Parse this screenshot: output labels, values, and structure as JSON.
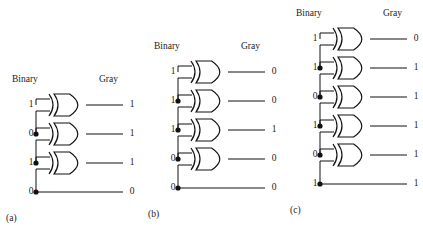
{
  "figure": {
    "background": "#ffffff",
    "line_color": "#111111",
    "text_color": "#1a1a1a"
  },
  "labels": {
    "binary": "Binary",
    "gray": "Gray"
  },
  "panels": [
    {
      "id": "a",
      "caption": "(a)",
      "origin_x": 4,
      "origin_y": 72,
      "header_y": 8,
      "first_row_y": 33,
      "row_step": 29,
      "rows": 4,
      "gates": 3,
      "inputs": [
        "1",
        "0",
        "1",
        "0"
      ],
      "outputs": [
        "1",
        "1",
        "1",
        "0"
      ],
      "binary_label_x": 8,
      "gray_label_x": 95,
      "input_x": 22,
      "output_x": 119,
      "gate_x": 50,
      "caption_x": 2,
      "caption_y": 145
    },
    {
      "id": "b",
      "caption": "(b)",
      "origin_x": 146,
      "origin_y": 39,
      "header_y": 8,
      "first_row_y": 33,
      "row_step": 29,
      "rows": 5,
      "gates": 4,
      "inputs": [
        "1",
        "1",
        "1",
        "0",
        "0"
      ],
      "outputs": [
        "0",
        "0",
        "1",
        "0",
        "0"
      ],
      "binary_label_x": 8,
      "gray_label_x": 95,
      "input_x": 22,
      "output_x": 119,
      "gate_x": 50,
      "caption_x": 2,
      "caption_y": 174
    },
    {
      "id": "c",
      "caption": "(c)",
      "origin_x": 288,
      "origin_y": 6,
      "header_y": 8,
      "first_row_y": 33,
      "row_step": 29,
      "rows": 6,
      "gates": 5,
      "inputs": [
        "1",
        "1",
        "0",
        "1",
        "0",
        "1"
      ],
      "outputs": [
        "0",
        "1",
        "1",
        "1",
        "1",
        "1"
      ],
      "binary_label_x": 8,
      "gray_label_x": 95,
      "input_x": 22,
      "output_x": 119,
      "gate_x": 50,
      "caption_x": 2,
      "caption_y": 203
    }
  ]
}
